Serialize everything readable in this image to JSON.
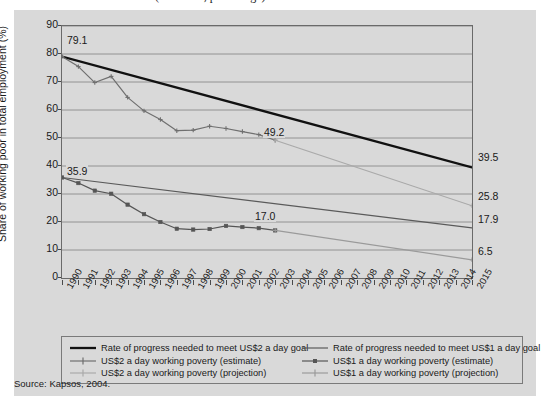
{
  "title_fragment": "(estimates, percentage)",
  "source": "Source: Kapsos, 2004.",
  "axes": {
    "y_title": "Share of working poor in total employment (%)",
    "y_ticks": [
      "90",
      "80",
      "70",
      "60",
      "50",
      "40",
      "30",
      "20",
      "10",
      "0"
    ],
    "y_min": 0,
    "y_max": 90,
    "x_ticks": [
      "1990",
      "1991",
      "1992",
      "1993",
      "1994",
      "1995",
      "1996",
      "1997",
      "1998",
      "1999",
      "2000",
      "2001",
      "2002",
      "2003",
      "2004",
      "2005",
      "2006",
      "2007",
      "2008",
      "2009",
      "2010",
      "2011",
      "2012",
      "2013",
      "2014",
      "2015"
    ]
  },
  "annotations": {
    "start_us2": "79.1",
    "start_us1": "35.9",
    "mid_us2": "49.2",
    "mid_us1": "17.0",
    "end_goal_us2": "39.5",
    "end_proj_us2": "25.8",
    "end_goal_us1": "17.9",
    "end_proj_us1": "6.5"
  },
  "legend": {
    "items": [
      {
        "label": "Rate of progress needed to meet US$2 a day goal",
        "key": "thick-line",
        "color": "#111111"
      },
      {
        "label": "US$2 a day working poverty (estimate)",
        "key": "line-plus-marker",
        "color": "#6f6f6f"
      },
      {
        "label": "US$2 a day working poverty (projection)",
        "key": "line-plus-marker-light",
        "color": "#a9a9a9"
      },
      {
        "label": "Rate of progress needed to meet US$1 a day goal",
        "key": "thin-line",
        "color": "#5a5a5a"
      },
      {
        "label": "US$1 a day working poverty (estimate)",
        "key": "line-square-marker",
        "color": "#555555"
      },
      {
        "label": "US$1 a day working poverty (projection)",
        "key": "line-plus-marker-light",
        "color": "#9a9a9a"
      }
    ]
  },
  "colors": {
    "panel_bg": "#d9d9d9",
    "grid": "#8a8a8a",
    "goal_us2": "#111111",
    "goal_us1": "#5a5a5a",
    "est_us2": "#6f6f6f",
    "est_us1": "#555555",
    "proj_us2": "#a9a9a9",
    "proj_us1": "#9a9a9a"
  },
  "chart_data": {
    "type": "line",
    "xlabel": "",
    "ylabel": "Share of working poor in total employment (%)",
    "xlim": [
      1990,
      2015
    ],
    "ylim": [
      0,
      90
    ],
    "grid": true,
    "legend_position": "bottom",
    "x": [
      1990,
      1991,
      1992,
      1993,
      1994,
      1995,
      1996,
      1997,
      1998,
      1999,
      2000,
      2001,
      2002,
      2003,
      2004,
      2005,
      2006,
      2007,
      2008,
      2009,
      2010,
      2011,
      2012,
      2013,
      2014,
      2015
    ],
    "series": [
      {
        "name": "Rate of progress needed to meet US$2 a day goal",
        "type": "goal-line",
        "x": [
          1990,
          2015
        ],
        "values": [
          79.1,
          39.5
        ]
      },
      {
        "name": "Rate of progress needed to meet US$1 a day goal",
        "type": "goal-line",
        "x": [
          1990,
          2015
        ],
        "values": [
          35.9,
          17.9
        ]
      },
      {
        "name": "US$2 a day working poverty (estimate)",
        "type": "estimate",
        "x": [
          1990,
          1991,
          1992,
          1993,
          1994,
          1995,
          1996,
          1997,
          1998,
          1999,
          2000,
          2001,
          2002,
          2003
        ],
        "values": [
          79.1,
          75.5,
          69.8,
          72.0,
          64.5,
          59.7,
          56.6,
          52.6,
          52.8,
          54.2,
          53.4,
          52.3,
          51.2,
          49.2
        ]
      },
      {
        "name": "US$2 a day working poverty (projection)",
        "type": "projection",
        "x": [
          2003,
          2015
        ],
        "values": [
          49.2,
          25.8
        ]
      },
      {
        "name": "US$1 a day working poverty (estimate)",
        "type": "estimate",
        "x": [
          1990,
          1991,
          1992,
          1993,
          1994,
          1995,
          1996,
          1997,
          1998,
          1999,
          2000,
          2001,
          2002,
          2003
        ],
        "values": [
          35.9,
          33.9,
          31.2,
          30.1,
          26.2,
          22.8,
          20.0,
          17.6,
          17.3,
          17.5,
          18.6,
          18.2,
          17.8,
          17.0
        ]
      },
      {
        "name": "US$1 a day working poverty (projection)",
        "type": "projection",
        "x": [
          2003,
          2015
        ],
        "values": [
          17.0,
          6.5
        ]
      }
    ]
  }
}
